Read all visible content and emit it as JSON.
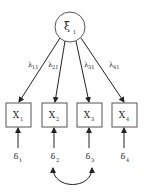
{
  "diagram": {
    "type": "measurement-model",
    "latent": {
      "symbol": "ξ",
      "subscript": "1"
    },
    "indicators": [
      {
        "symbol": "X",
        "subscript": "1",
        "loading": {
          "symbol": "λ",
          "subscript": "11"
        },
        "error": {
          "symbol": "δ",
          "subscript": "1"
        }
      },
      {
        "symbol": "X",
        "subscript": "2",
        "loading": {
          "symbol": "λ",
          "subscript": "21"
        },
        "error": {
          "symbol": "δ",
          "subscript": "2"
        }
      },
      {
        "symbol": "X",
        "subscript": "3",
        "loading": {
          "symbol": "λ",
          "subscript": "31"
        },
        "error": {
          "symbol": "δ",
          "subscript": "3"
        }
      },
      {
        "symbol": "X",
        "subscript": "4",
        "loading": {
          "symbol": "λ",
          "subscript": "41"
        },
        "error": {
          "symbol": "δ",
          "subscript": "4"
        }
      }
    ],
    "correlated_errors": [
      [
        "δ2",
        "δ3"
      ]
    ],
    "colors": {
      "stroke": "#333333",
      "fill": "#ffffff",
      "text": "#222222"
    }
  }
}
